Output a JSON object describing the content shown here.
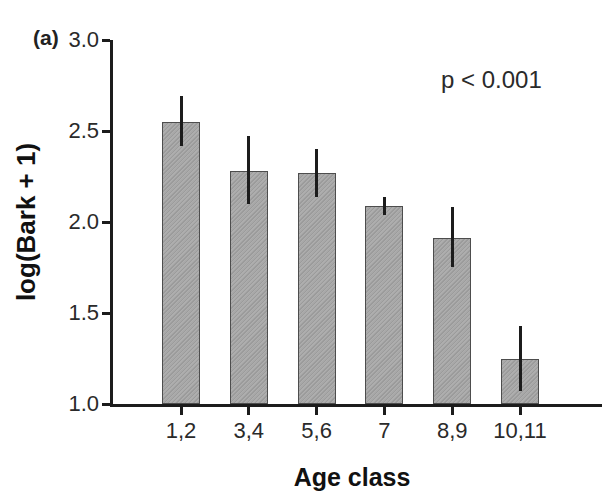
{
  "chart_data": {
    "type": "bar",
    "title": "",
    "panel_label": "(a)",
    "annotation": "p < 0.001",
    "xlabel": "Age class",
    "ylabel": "log(Bark + 1)",
    "categories": [
      "1,2",
      "3,4",
      "5,6",
      "7",
      "8,9",
      "10,11"
    ],
    "values": [
      2.55,
      2.28,
      2.27,
      2.09,
      1.91,
      1.25
    ],
    "error_low": [
      2.42,
      2.1,
      2.14,
      2.04,
      1.75,
      1.07
    ],
    "error_high": [
      2.69,
      2.47,
      2.4,
      2.14,
      2.08,
      1.43
    ],
    "ylim": [
      1.0,
      3.0
    ],
    "yticks": [
      {
        "label": "1.0",
        "value": 1.0
      },
      {
        "label": "1.5",
        "value": 1.5
      },
      {
        "label": "2.0",
        "value": 2.0
      },
      {
        "label": "2.5",
        "value": 2.5
      },
      {
        "label": "3.0",
        "value": 3.0
      }
    ],
    "grid": false,
    "legend": "none",
    "bar_color": "#a8a8a8",
    "bar_border_color": "#4d4d4d",
    "error_bar_color": "#1c1c1c",
    "axis_color": "#1c1c1c"
  }
}
